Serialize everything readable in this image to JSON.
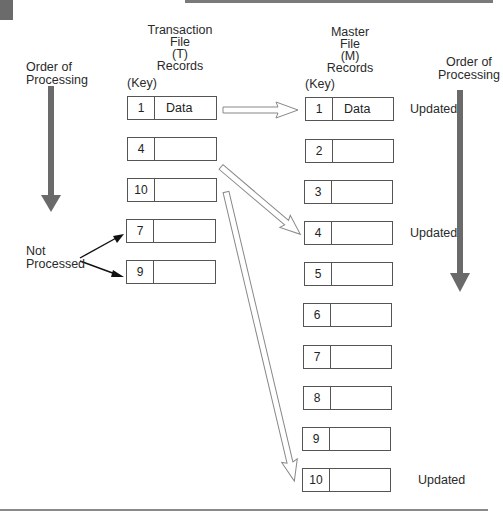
{
  "transaction_file": {
    "header_lines": [
      "Transaction",
      "File",
      "(T)",
      "Records"
    ],
    "key_label": "(Key)",
    "records": [
      {
        "key": "1",
        "data": "Data"
      },
      {
        "key": "4",
        "data": ""
      },
      {
        "key": "10",
        "data": ""
      },
      {
        "key": "7",
        "data": ""
      },
      {
        "key": "9",
        "data": ""
      }
    ]
  },
  "master_file": {
    "header_lines": [
      "Master",
      "File",
      "(M)",
      "Records"
    ],
    "key_label": "(Key)",
    "records": [
      {
        "key": "1",
        "data": "Data",
        "status": "Updated"
      },
      {
        "key": "2",
        "data": "",
        "status": ""
      },
      {
        "key": "3",
        "data": "",
        "status": ""
      },
      {
        "key": "4",
        "data": "",
        "status": "Updated"
      },
      {
        "key": "5",
        "data": "",
        "status": ""
      },
      {
        "key": "6",
        "data": "",
        "status": ""
      },
      {
        "key": "7",
        "data": "",
        "status": ""
      },
      {
        "key": "8",
        "data": "",
        "status": ""
      },
      {
        "key": "9",
        "data": "",
        "status": ""
      },
      {
        "key": "10",
        "data": "",
        "status": "Updated"
      }
    ]
  },
  "left_order": {
    "line1": "Order of",
    "line2": "Processing"
  },
  "right_order": {
    "line1": "Order of",
    "line2": "Processing"
  },
  "not_processed": {
    "line1": "Not",
    "line2": "Processed"
  },
  "colors": {
    "order_arrow": "#6a6a6a",
    "box_border": "#555555",
    "text": "#2a2a2a"
  }
}
